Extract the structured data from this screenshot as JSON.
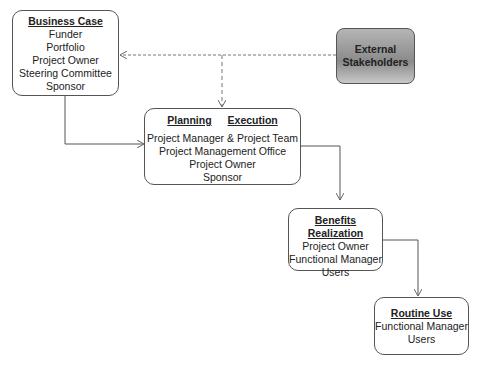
{
  "business_case": {
    "title": "Business Case",
    "items": [
      "Funder",
      "Portfolio",
      "Project Owner",
      "Steering Committee",
      "Sponsor"
    ]
  },
  "external": {
    "line1": "External",
    "line2": "Stakeholders"
  },
  "planning_execution": {
    "planning": "Planning",
    "execution": "Execution",
    "items": [
      "Project Manager & Project Team",
      "Project Management Office",
      "Project Owner",
      "Sponsor"
    ]
  },
  "benefits": {
    "title": "Benefits Realization",
    "items": [
      "Project Owner",
      "Functional Manager",
      "Users"
    ]
  },
  "routine": {
    "title": "Routine Use",
    "items": [
      "Functional Manager",
      "Users"
    ]
  }
}
